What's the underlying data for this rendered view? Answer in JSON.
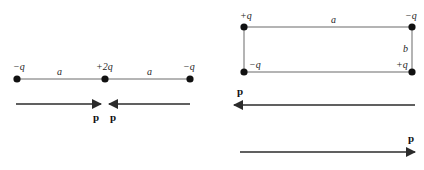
{
  "figure": {
    "background_color": "#ffffff",
    "stroke_color": "#3a3a3a",
    "dot_color": "#111111",
    "arrow_color": "#2b2b2b"
  },
  "left_diagram": {
    "name": "collinear-three-charge-diagram",
    "charges": [
      {
        "label": "−q",
        "position": "left-end"
      },
      {
        "label": "+2q",
        "position": "center"
      },
      {
        "label": "−q",
        "position": "right-end"
      }
    ],
    "separations": [
      {
        "label": "a",
        "between": "left-to-center"
      },
      {
        "label": "a",
        "between": "center-to-right"
      }
    ],
    "vectors": [
      {
        "label": "p",
        "direction": "right",
        "name": "left-dipole-vector"
      },
      {
        "label": "p",
        "direction": "left",
        "name": "right-dipole-vector"
      }
    ]
  },
  "right_diagram": {
    "name": "rectangular-four-charge-diagram",
    "charges": [
      {
        "label": "+q",
        "position": "top-left"
      },
      {
        "label": "−q",
        "position": "top-right"
      },
      {
        "label": "−q",
        "position": "bottom-left"
      },
      {
        "label": "+q",
        "position": "bottom-right"
      }
    ],
    "sides": [
      {
        "label": "a",
        "position": "top"
      },
      {
        "label": "b",
        "position": "right"
      }
    ],
    "vectors": [
      {
        "label": "p",
        "direction": "left",
        "name": "upper-dipole-vector"
      },
      {
        "label": "p",
        "direction": "right",
        "name": "lower-dipole-vector"
      }
    ]
  }
}
